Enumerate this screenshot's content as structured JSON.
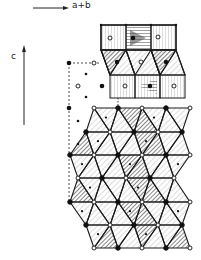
{
  "diagram": {
    "type": "crystal-structure-projection",
    "axes": {
      "horizontal": {
        "label": "a+b",
        "direction": "right"
      },
      "vertical": {
        "label": "c",
        "direction": "up"
      }
    },
    "legend": {
      "filled_circle": "cation (filled)",
      "open_circle": "cation (open)",
      "small_dot": "minor site"
    },
    "colors": {
      "line": "#1a1a1a",
      "hatch_dark": "#333333",
      "hatch_light": "#888888",
      "background": "#ffffff"
    },
    "blocks": [
      {
        "name": "upper-octahedral-layer",
        "shape": "squares",
        "count": 3
      },
      {
        "name": "sheared-layer",
        "shape": "parallelograms",
        "count": 3
      },
      {
        "name": "middle-octahedral-layer",
        "shape": "squares",
        "count": 3
      },
      {
        "name": "lower-close-packed-block",
        "shape": "triangles",
        "rows": 6
      }
    ]
  }
}
